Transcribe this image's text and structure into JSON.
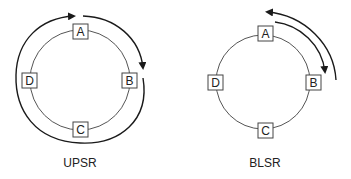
{
  "diagrams": [
    {
      "id": "upsr",
      "caption": "UPSR",
      "nodes": [
        {
          "label": "A"
        },
        {
          "label": "B"
        },
        {
          "label": "C"
        },
        {
          "label": "D"
        }
      ]
    },
    {
      "id": "blsr",
      "caption": "BLSR",
      "nodes": [
        {
          "label": "A"
        },
        {
          "label": "B"
        },
        {
          "label": "C"
        },
        {
          "label": "D"
        }
      ]
    }
  ],
  "colors": {
    "line": "#444444",
    "arrow": "#1a1a1a",
    "box_fill": "#ffffff"
  }
}
